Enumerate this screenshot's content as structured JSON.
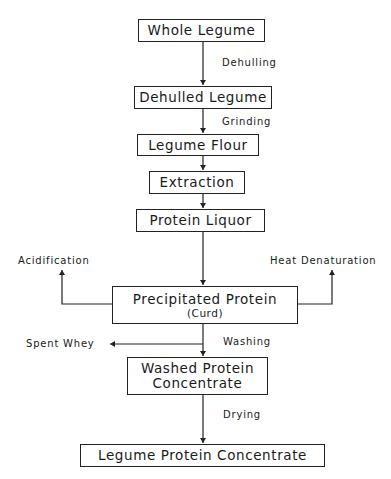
{
  "diagram": {
    "nodes": [
      {
        "id": "whole_legume",
        "label": "Whole Legume"
      },
      {
        "id": "dehulled_legume",
        "label": "Dehulled Legume"
      },
      {
        "id": "legume_flour",
        "label": "Legume Flour"
      },
      {
        "id": "extraction",
        "label": "Extraction"
      },
      {
        "id": "protein_liquor",
        "label": "Protein Liquor"
      },
      {
        "id": "precipitated_protein",
        "label": "Precipitated Protein",
        "sublabel": "(Curd)"
      },
      {
        "id": "washed_protein",
        "label_line1": "Washed Protein",
        "label_line2": "Concentrate"
      },
      {
        "id": "legume_protein_concentrate",
        "label": "Legume Protein Concentrate"
      }
    ],
    "edge_labels": {
      "dehulling": "Dehulling",
      "grinding": "Grinding",
      "washing": "Washing",
      "drying": "Drying"
    },
    "side_outputs": {
      "acidification": "Acidification",
      "heat_denaturation": "Heat Denaturation",
      "spent_whey": "Spent Whey"
    },
    "edges": [
      {
        "from": "whole_legume",
        "to": "dehulled_legume",
        "label": "Dehulling"
      },
      {
        "from": "dehulled_legume",
        "to": "legume_flour",
        "label": "Grinding"
      },
      {
        "from": "legume_flour",
        "to": "extraction"
      },
      {
        "from": "extraction",
        "to": "protein_liquor"
      },
      {
        "from": "protein_liquor",
        "to": "precipitated_protein"
      },
      {
        "from": "precipitated_protein",
        "to": "Acidification"
      },
      {
        "from": "precipitated_protein",
        "to": "Heat Denaturation"
      },
      {
        "from": "precipitated_protein",
        "to": "washed_protein",
        "label": "Washing"
      },
      {
        "from": "precipitated_protein",
        "to": "Spent Whey"
      },
      {
        "from": "washed_protein",
        "to": "legume_protein_concentrate",
        "label": "Drying"
      }
    ]
  }
}
